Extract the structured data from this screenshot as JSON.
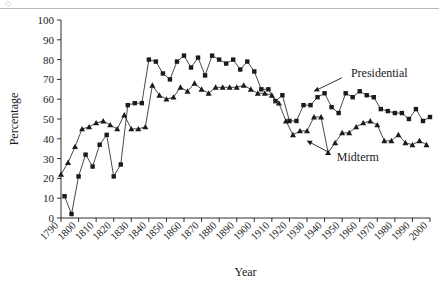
{
  "figure": {
    "has_top_rule": true,
    "background": "#ffffff",
    "ink_color": "#1a1a1a"
  },
  "chart_data": {
    "type": "line",
    "title": "",
    "xlabel": "Year",
    "ylabel": "Percentage",
    "xlim": [
      1790,
      2000
    ],
    "ylim": [
      0,
      100
    ],
    "yticks": [
      0,
      10,
      20,
      30,
      40,
      50,
      60,
      70,
      80,
      90,
      100
    ],
    "xticks": [
      1790,
      1800,
      1810,
      1820,
      1830,
      1840,
      1850,
      1860,
      1870,
      1880,
      1890,
      1900,
      1910,
      1920,
      1930,
      1940,
      1950,
      1960,
      1970,
      1980,
      1990,
      2000
    ],
    "xtick_labels": [
      "1790",
      "1800",
      "1810",
      "1820",
      "1830",
      "1840",
      "1850",
      "1860",
      "1870",
      "1880",
      "1890",
      "1900",
      "1910",
      "1920",
      "1930",
      "1940",
      "1950",
      "1960",
      "1970",
      "1980",
      "1990",
      "2000"
    ],
    "xtick_rotation": 45,
    "grid": false,
    "legend_position": "annotations",
    "series": [
      {
        "name": "Presidential",
        "marker": "square",
        "color": "#1a1a1a",
        "x": [
          1792,
          1796,
          1800,
          1804,
          1808,
          1812,
          1816,
          1820,
          1824,
          1828,
          1832,
          1836,
          1840,
          1844,
          1848,
          1852,
          1856,
          1860,
          1864,
          1868,
          1872,
          1876,
          1880,
          1884,
          1888,
          1892,
          1896,
          1900,
          1904,
          1908,
          1912,
          1916,
          1920,
          1924,
          1928,
          1932,
          1936,
          1940,
          1944,
          1948,
          1952,
          1956,
          1960,
          1964,
          1968,
          1972,
          1976,
          1980,
          1984,
          1988,
          1992,
          1996,
          2000
        ],
        "y": [
          11,
          2,
          21,
          32,
          26,
          37,
          42,
          21,
          27,
          57,
          58,
          58,
          80,
          79,
          73,
          70,
          79,
          82,
          76,
          81,
          72,
          82,
          80,
          78,
          80,
          75,
          79,
          74,
          65,
          65,
          59,
          62,
          49,
          49,
          57,
          57,
          61,
          63,
          56,
          53,
          63,
          61,
          64,
          62,
          61,
          55,
          54,
          53,
          53,
          50,
          55,
          49,
          51
        ]
      },
      {
        "name": "Midterm",
        "marker": "triangle",
        "color": "#1a1a1a",
        "x": [
          1790,
          1794,
          1798,
          1802,
          1806,
          1810,
          1814,
          1818,
          1822,
          1826,
          1830,
          1834,
          1838,
          1842,
          1846,
          1850,
          1854,
          1858,
          1862,
          1866,
          1870,
          1874,
          1878,
          1882,
          1886,
          1890,
          1894,
          1898,
          1902,
          1906,
          1910,
          1914,
          1918,
          1922,
          1926,
          1930,
          1934,
          1938,
          1942,
          1946,
          1950,
          1954,
          1958,
          1962,
          1966,
          1970,
          1974,
          1978,
          1982,
          1986,
          1990,
          1994,
          1998
        ],
        "y": [
          22,
          28,
          36,
          45,
          46,
          48,
          49,
          47,
          45,
          52,
          45,
          45,
          46,
          67,
          62,
          60,
          61,
          66,
          64,
          68,
          65,
          63,
          66,
          66,
          66,
          66,
          67,
          65,
          63,
          63,
          62,
          58,
          49,
          42,
          44,
          44,
          51,
          51,
          33,
          38,
          43,
          43,
          46,
          48,
          49,
          47,
          39,
          39,
          42,
          38,
          37,
          39,
          37
        ]
      }
    ],
    "annotations": [
      {
        "text": "Presidential",
        "x": 1955,
        "y": 73,
        "arrow_to": {
          "x": 1934,
          "y": 64
        }
      },
      {
        "text": "Midterm",
        "x": 1947,
        "y": 31,
        "arrow_to": {
          "x": 1930,
          "y": 39
        }
      }
    ]
  }
}
